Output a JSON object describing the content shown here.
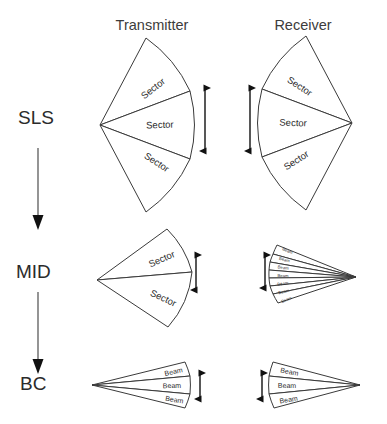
{
  "figure": {
    "columns": [
      {
        "id": "transmitter",
        "label": "Transmitter",
        "x": 152
      },
      {
        "id": "receiver",
        "label": "Receiver",
        "x": 303
      }
    ],
    "stages": [
      {
        "id": "sls",
        "label": "SLS",
        "x": 18,
        "y": 124
      },
      {
        "id": "mid",
        "label": "MID",
        "x": 16,
        "y": 278
      },
      {
        "id": "bc",
        "label": "BC",
        "x": 20,
        "y": 390
      }
    ],
    "flow_arrows": [
      {
        "id": "sls-to-mid",
        "x": 38,
        "y1": 148,
        "y2": 228
      },
      {
        "id": "mid-to-bc",
        "x": 38,
        "y1": 292,
        "y2": 372
      }
    ],
    "sector_label": "Sector",
    "beam_label": "Beam",
    "cells": [
      {
        "id": "sls-transmitter",
        "stage": "SLS",
        "role": "Transmitter",
        "shape_label": "Sector",
        "divisions": 3,
        "labels": [
          "Sector",
          "Sector",
          "Sector"
        ]
      },
      {
        "id": "sls-receiver",
        "stage": "SLS",
        "role": "Receiver",
        "shape_label": "Sector",
        "divisions": 3,
        "labels": [
          "Sector",
          "Sector",
          "Sector"
        ]
      },
      {
        "id": "mid-transmitter",
        "stage": "MID",
        "role": "Transmitter",
        "shape_label": "Sector",
        "divisions": 2,
        "labels": [
          "Sector",
          "Sector"
        ]
      },
      {
        "id": "mid-receiver",
        "stage": "MID",
        "role": "Receiver",
        "shape_label": "Beam",
        "divisions": 7,
        "labels": [
          "Beam",
          "Beam",
          "Beam",
          "Beam",
          "Beam",
          "Beam",
          "Beam"
        ]
      },
      {
        "id": "bc-transmitter",
        "stage": "BC",
        "role": "Transmitter",
        "shape_label": "Beam",
        "divisions": 3,
        "labels": [
          "Beam",
          "Beam",
          "Beam"
        ]
      },
      {
        "id": "bc-receiver",
        "stage": "BC",
        "role": "Receiver",
        "shape_label": "Beam",
        "divisions": 3,
        "labels": [
          "Beam",
          "Beam",
          "Beam"
        ]
      }
    ],
    "beamwidth_arrows": [
      {
        "id": "sls-transmitter-beamwidth",
        "x": 205,
        "y1": 83,
        "y2": 156
      },
      {
        "id": "sls-receiver-beamwidth",
        "x": 250,
        "y1": 83,
        "y2": 156
      },
      {
        "id": "mid-transmitter-beamwidth",
        "x": 196,
        "y1": 252,
        "y2": 292
      },
      {
        "id": "mid-receiver-beamwidth",
        "x": 265,
        "y1": 252,
        "y2": 290
      },
      {
        "id": "bc-transmitter-beamwidth",
        "x": 200,
        "y1": 372,
        "y2": 400
      },
      {
        "id": "bc-receiver-beamwidth",
        "x": 262,
        "y1": 372,
        "y2": 400
      }
    ],
    "colors": {
      "stroke": "#3a3a3a",
      "text": "#2b2b2b",
      "arrow": "#111111",
      "flow": "#7a7a7a",
      "background": "#ffffff"
    }
  }
}
